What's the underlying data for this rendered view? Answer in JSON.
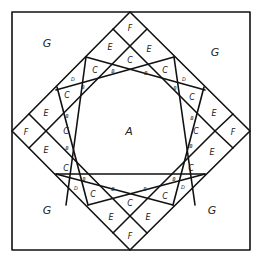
{
  "diagram": {
    "type": "quilt-block-pattern",
    "outer_square": {
      "x1": 12,
      "y1": 12,
      "x2": 250,
      "y2": 250
    },
    "piece_labels": {
      "center": "A",
      "corners": [
        "G",
        "G",
        "G",
        "G"
      ],
      "diamond_points": [
        "F",
        "F",
        "F",
        "F"
      ],
      "band_pieces": "E",
      "ring_pieces": "C",
      "small_triangles": "B",
      "diamond_pieces": "D"
    },
    "labels": [
      {
        "text": "G",
        "x": 47,
        "y": 43,
        "size": "big"
      },
      {
        "text": "G",
        "x": 215,
        "y": 52,
        "size": "big"
      },
      {
        "text": "G",
        "x": 47,
        "y": 210,
        "size": "big"
      },
      {
        "text": "G",
        "x": 212,
        "y": 210,
        "size": "big"
      },
      {
        "text": "A",
        "x": 129,
        "y": 131,
        "size": "big"
      },
      {
        "text": "F",
        "x": 130,
        "y": 28,
        "size": "med"
      },
      {
        "text": "F",
        "x": 26,
        "y": 132,
        "size": "med"
      },
      {
        "text": "F",
        "x": 233,
        "y": 132,
        "size": "med"
      },
      {
        "text": "F",
        "x": 130,
        "y": 236,
        "size": "med"
      },
      {
        "text": "E",
        "x": 110,
        "y": 47,
        "size": "med"
      },
      {
        "text": "E",
        "x": 149,
        "y": 49,
        "size": "med"
      },
      {
        "text": "E",
        "x": 46,
        "y": 113,
        "size": "med"
      },
      {
        "text": "E",
        "x": 46,
        "y": 150,
        "size": "med"
      },
      {
        "text": "E",
        "x": 214,
        "y": 113,
        "size": "med"
      },
      {
        "text": "E",
        "x": 212,
        "y": 152,
        "size": "med"
      },
      {
        "text": "E",
        "x": 111,
        "y": 217,
        "size": "med"
      },
      {
        "text": "E",
        "x": 148,
        "y": 217,
        "size": "med"
      },
      {
        "text": "C",
        "x": 130,
        "y": 60,
        "size": "med"
      },
      {
        "text": "C",
        "x": 66,
        "y": 131,
        "size": "med"
      },
      {
        "text": "C",
        "x": 196,
        "y": 131,
        "size": "med"
      },
      {
        "text": "C",
        "x": 130,
        "y": 203,
        "size": "med"
      },
      {
        "text": "C",
        "x": 95,
        "y": 70,
        "size": "med"
      },
      {
        "text": "C",
        "x": 67,
        "y": 95,
        "size": "med"
      },
      {
        "text": "C",
        "x": 165,
        "y": 70,
        "size": "med"
      },
      {
        "text": "C",
        "x": 192,
        "y": 97,
        "size": "med"
      },
      {
        "text": "C",
        "x": 66,
        "y": 168,
        "size": "med"
      },
      {
        "text": "C",
        "x": 93,
        "y": 194,
        "size": "med"
      },
      {
        "text": "C",
        "x": 191,
        "y": 168,
        "size": "med"
      },
      {
        "text": "C",
        "x": 165,
        "y": 196,
        "size": "med"
      },
      {
        "text": "D",
        "x": 73,
        "y": 79,
        "size": "sm"
      },
      {
        "text": "D",
        "x": 184,
        "y": 79,
        "size": "sm"
      },
      {
        "text": "D",
        "x": 76,
        "y": 188,
        "size": "sm"
      },
      {
        "text": "D",
        "x": 183,
        "y": 187,
        "size": "sm"
      },
      {
        "text": "B",
        "x": 113,
        "y": 71,
        "size": "sm"
      },
      {
        "text": "B",
        "x": 146,
        "y": 73,
        "size": "sm"
      },
      {
        "text": "B",
        "x": 83,
        "y": 87,
        "size": "sm"
      },
      {
        "text": "B",
        "x": 175,
        "y": 88,
        "size": "sm"
      },
      {
        "text": "B",
        "x": 67,
        "y": 116,
        "size": "sm"
      },
      {
        "text": "B",
        "x": 192,
        "y": 118,
        "size": "sm"
      },
      {
        "text": "B",
        "x": 67,
        "y": 148,
        "size": "sm"
      },
      {
        "text": "B",
        "x": 191,
        "y": 146,
        "size": "sm"
      },
      {
        "text": "B",
        "x": 84,
        "y": 179,
        "size": "sm"
      },
      {
        "text": "B",
        "x": 174,
        "y": 179,
        "size": "sm"
      },
      {
        "text": "B",
        "x": 113,
        "y": 189,
        "size": "sm"
      },
      {
        "text": "B",
        "x": 145,
        "y": 189,
        "size": "sm"
      }
    ]
  }
}
